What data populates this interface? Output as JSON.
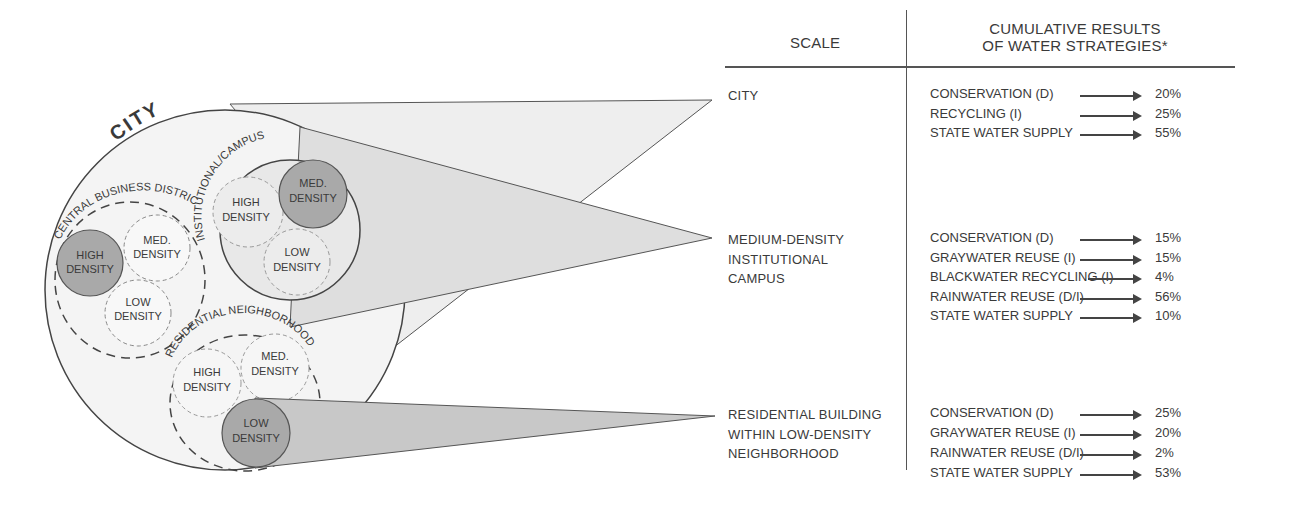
{
  "header": {
    "scale": "SCALE",
    "results_line1": "CUMULATIVE RESULTS",
    "results_line2": "OF WATER STRATEGIES*"
  },
  "diagram": {
    "city_label": "CITY",
    "cbd_label": "CENTRAL BUSINESS DISTRICT",
    "campus_label": "INSTITUTIONAL/CAMPUS",
    "neighborhood_label": "RESIDENTIAL NEIGHBORHOOD",
    "cbd": {
      "high": [
        "HIGH",
        "DENSITY"
      ],
      "med": [
        "MED.",
        "DENSITY"
      ],
      "low": [
        "LOW",
        "DENSITY"
      ]
    },
    "campus": {
      "high": [
        "HIGH",
        "DENSITY"
      ],
      "med": [
        "MED.",
        "DENSITY"
      ],
      "low": [
        "LOW",
        "DENSITY"
      ]
    },
    "neighborhood": {
      "high": [
        "HIGH",
        "DENSITY"
      ],
      "med": [
        "MED.",
        "DENSITY"
      ],
      "low": [
        "LOW",
        "DENSITY"
      ]
    },
    "colors": {
      "highlight_fill": "#a9a9a9",
      "cone_light": "#ececec",
      "cone_mid": "#dcdcdc",
      "cone_dark": "#c4c4c4",
      "stroke": "#444444"
    }
  },
  "sections": [
    {
      "scale": "CITY",
      "strategies": [
        {
          "name": "CONSERVATION (D)",
          "value": "20%"
        },
        {
          "name": "RECYCLING (I)",
          "value": "25%"
        },
        {
          "name": "STATE WATER SUPPLY",
          "value": "55%"
        }
      ]
    },
    {
      "scale": "MEDIUM-DENSITY\nINSTITUTIONAL\nCAMPUS",
      "strategies": [
        {
          "name": "CONSERVATION (D)",
          "value": "15%"
        },
        {
          "name": "GRAYWATER REUSE (I)",
          "value": "15%"
        },
        {
          "name": "BLACKWATER RECYCLING (I)",
          "value": "4%"
        },
        {
          "name": "RAINWATER REUSE (D/I)",
          "value": "56%"
        },
        {
          "name": "STATE WATER SUPPLY",
          "value": "10%"
        }
      ]
    },
    {
      "scale": "RESIDENTIAL BUILDING\nWITHIN LOW-DENSITY\nNEIGHBORHOOD",
      "strategies": [
        {
          "name": "CONSERVATION (D)",
          "value": "25%"
        },
        {
          "name": "GRAYWATER REUSE (I)",
          "value": "20%"
        },
        {
          "name": "RAINWATER REUSE (D/I)",
          "value": "2%"
        },
        {
          "name": "STATE WATER SUPPLY",
          "value": "53%"
        }
      ]
    }
  ]
}
